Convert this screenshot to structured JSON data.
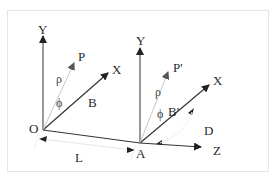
{
  "diagram": {
    "colors": {
      "axis": "#2a2a2a",
      "vector_light": "#bdbdbd",
      "frame_border": "#e6e6e6",
      "background": "#ffffff"
    },
    "frame_O": {
      "origin_label": "O",
      "y_axis_label": "Y",
      "x_axis_label": "X",
      "point_label": "P",
      "rho_label": "ρ",
      "phi_label": "ϕ",
      "baseline_label": "B"
    },
    "frame_A": {
      "origin_label": "A",
      "y_axis_label": "Y",
      "x_axis_label": "X",
      "point_label": "P'",
      "rho_label": "ρ",
      "phi_label": "ϕ",
      "baseline_label": "B'",
      "z_axis_label": "Z",
      "displacement_label": "D"
    },
    "separation_label": "L"
  }
}
